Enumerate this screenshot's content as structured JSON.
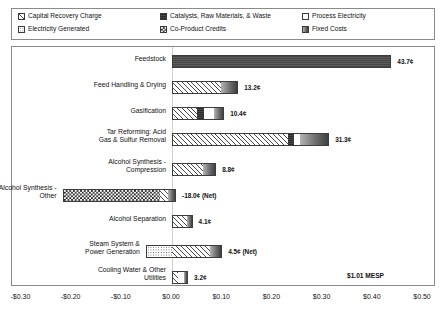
{
  "chart_data": {
    "type": "bar",
    "orientation": "horizontal",
    "stacked": true,
    "title": "",
    "xlabel": "",
    "ylabel": "",
    "xlim": [
      -0.3,
      0.5
    ],
    "xticks": [
      "-$0.30",
      "-$0.20",
      "-$0.10",
      "$0.00",
      "$0.10",
      "$0.20",
      "$0.30",
      "$0.40",
      "$0.50"
    ],
    "xtick_values": [
      -0.3,
      -0.2,
      -0.1,
      0.0,
      0.1,
      0.2,
      0.3,
      0.4,
      0.5
    ],
    "grid": false,
    "legend_position": "top",
    "total_label": "$1.01 MESP",
    "total_value": 1.01,
    "series": [
      {
        "name": "Capital Recovery Charge",
        "pattern": "diagonal-hatch"
      },
      {
        "name": "Catalysts, Raw Materials, & Waste",
        "pattern": "dark-solid"
      },
      {
        "name": "Process Electricity",
        "pattern": "white"
      },
      {
        "name": "Electricity Generated",
        "pattern": "dotted"
      },
      {
        "name": "Co-Product Credits",
        "pattern": "checkerboard"
      },
      {
        "name": "Fixed Costs",
        "pattern": "gray-gradient"
      }
    ],
    "categories": [
      "Feedstock",
      "Feed Handling & Drying",
      "Gasification",
      "Tar Reforming: Acid Gas & Sulfur Removal",
      "Alcohol Synthesis - Compression",
      "Alcohol Synthesis - Other",
      "Alcohol Separation",
      "Steam System & Power Generation",
      "Cooling Water & Other Utilities"
    ],
    "values": [
      0.437,
      0.132,
      0.104,
      0.313,
      0.088,
      -0.18,
      0.041,
      0.045,
      0.032
    ]
  },
  "legend": {
    "items": [
      {
        "label": "Capital Recovery Charge",
        "pattern": "p-capital",
        "col": 0,
        "row": 0
      },
      {
        "label": "Catalysts, Raw Materials, & Waste",
        "pattern": "p-catalyst",
        "col": 1,
        "row": 0
      },
      {
        "label": "Process Electricity",
        "pattern": "p-electricity",
        "col": 2,
        "row": 0
      },
      {
        "label": "Electricity Generated",
        "pattern": "p-generated",
        "col": 0,
        "row": 1
      },
      {
        "label": "Co-Product Credits",
        "pattern": "p-coproduct",
        "col": 1,
        "row": 1
      },
      {
        "label": "Fixed Costs",
        "pattern": "p-fixed",
        "col": 2,
        "row": 1
      }
    ]
  },
  "rows": [
    {
      "label": "Feedstock",
      "value_label": "43.7¢",
      "segments": [
        {
          "pattern": "p-feedstock",
          "start": 0.0,
          "end": 0.437
        }
      ]
    },
    {
      "label": "Feed Handling & Drying",
      "value_label": "13.2¢",
      "segments": [
        {
          "pattern": "p-capital",
          "start": 0.0,
          "end": 0.098
        },
        {
          "pattern": "p-fixed",
          "start": 0.098,
          "end": 0.132
        }
      ]
    },
    {
      "label": "Gasification",
      "value_label": "10.4¢",
      "segments": [
        {
          "pattern": "p-capital",
          "start": 0.0,
          "end": 0.05
        },
        {
          "pattern": "p-catalyst",
          "start": 0.05,
          "end": 0.064
        },
        {
          "pattern": "p-electricity",
          "start": 0.064,
          "end": 0.086
        },
        {
          "pattern": "p-fixed",
          "start": 0.086,
          "end": 0.104
        }
      ]
    },
    {
      "label": "Tar Reforming: Acid\nGas & Sulfur Removal",
      "value_label": "31.3¢",
      "segments": [
        {
          "pattern": "p-capital",
          "start": 0.0,
          "end": 0.233
        },
        {
          "pattern": "p-catalyst",
          "start": 0.233,
          "end": 0.245
        },
        {
          "pattern": "p-electricity",
          "start": 0.245,
          "end": 0.256
        },
        {
          "pattern": "p-fixed",
          "start": 0.256,
          "end": 0.313
        }
      ]
    },
    {
      "label": "Alcohol Synthesis -\nCompression",
      "value_label": "8.8¢",
      "segments": [
        {
          "pattern": "p-capital",
          "start": 0.0,
          "end": 0.062
        },
        {
          "pattern": "p-fixed",
          "start": 0.062,
          "end": 0.088
        }
      ]
    },
    {
      "label": "Alcohol Synthesis -\nOther",
      "value_label": "-18.0¢ (Net)",
      "segments": [
        {
          "pattern": "p-coproduct",
          "start": -0.218,
          "end": -0.023
        },
        {
          "pattern": "p-capital",
          "start": -0.023,
          "end": -0.007
        },
        {
          "pattern": "p-fixed",
          "start": -0.007,
          "end": 0.008
        }
      ]
    },
    {
      "label": "Alcohol Separation",
      "value_label": "4.1¢",
      "segments": [
        {
          "pattern": "p-capital",
          "start": 0.0,
          "end": 0.03
        },
        {
          "pattern": "p-fixed",
          "start": 0.03,
          "end": 0.041
        }
      ]
    },
    {
      "label": "Steam System &\nPower Generation",
      "value_label": "4.5¢ (Net)",
      "segments": [
        {
          "pattern": "p-generated",
          "start": -0.052,
          "end": 0.0
        },
        {
          "pattern": "p-capital",
          "start": 0.0,
          "end": 0.078
        },
        {
          "pattern": "p-fixed",
          "start": 0.078,
          "end": 0.1
        }
      ]
    },
    {
      "label": "Cooling Water & Other\nUtilities",
      "value_label": "3.2¢",
      "segments": [
        {
          "pattern": "p-capital",
          "start": 0.0,
          "end": 0.012
        },
        {
          "pattern": "p-electricity",
          "start": 0.012,
          "end": 0.024
        },
        {
          "pattern": "p-fixed",
          "start": 0.024,
          "end": 0.032
        }
      ]
    }
  ],
  "mesp": {
    "label": "$1.01 MESP"
  },
  "axis": {
    "ticks": [
      "-$0.30",
      "-$0.20",
      "-$0.10",
      "$0.00",
      "$0.10",
      "$0.20",
      "$0.30",
      "$0.40",
      "$0.50"
    ],
    "values": [
      -0.3,
      -0.2,
      -0.1,
      0.0,
      0.1,
      0.2,
      0.3,
      0.4,
      0.5
    ]
  }
}
